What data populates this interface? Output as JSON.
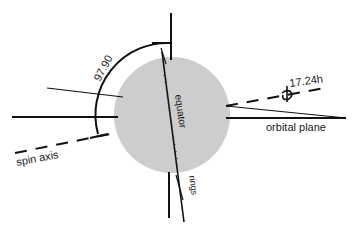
{
  "diagram": {
    "title": "",
    "labels": {
      "angle": "97.90",
      "rotation_period": "17.24h",
      "orbital_plane": "orbital plane",
      "spin_axis": "spin axis",
      "equator": "equator",
      "rings": "rings"
    },
    "colors": {
      "planet_fill": "#cdcdcd",
      "stroke": "#111111",
      "background": "#ffffff"
    }
  }
}
